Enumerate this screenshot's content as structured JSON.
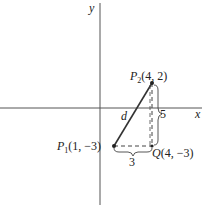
{
  "diagram": {
    "type": "coordinate-plane distance figure",
    "axes": {
      "x_label": "x",
      "y_label": "y"
    },
    "points": {
      "P1": {
        "name": "P",
        "subscript": "1",
        "coords": "(1, −3)"
      },
      "P2": {
        "name": "P",
        "subscript": "2",
        "coords": "(4, 2)"
      },
      "Q": {
        "name": "Q",
        "subscript": "",
        "coords": "(4, −3)"
      }
    },
    "segment_label": "d",
    "vertical_leg_label": "5",
    "horizontal_leg_label": "3",
    "colors": {
      "line": "#333333",
      "axis": "#555555",
      "text": "#222222"
    }
  }
}
